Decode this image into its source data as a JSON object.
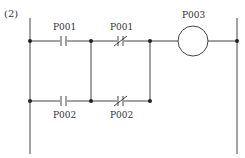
{
  "figure": {
    "number_label": "(2)",
    "type": "ladder-diagram",
    "colors": {
      "line": "#444444",
      "background": "#ffffff"
    }
  },
  "rungs": [
    {
      "elements": [
        {
          "kind": "contact-no",
          "label": "P001"
        },
        {
          "kind": "contact-nc",
          "label": "P001"
        },
        {
          "kind": "coil",
          "label": "P003"
        }
      ]
    },
    {
      "elements": [
        {
          "kind": "contact-no",
          "label": "P002"
        },
        {
          "kind": "contact-nc",
          "label": "P002"
        }
      ]
    }
  ],
  "labels": {
    "top_no": "P001",
    "top_nc": "P001",
    "coil": "P003",
    "bottom_no": "P002",
    "bottom_nc": "P002"
  }
}
